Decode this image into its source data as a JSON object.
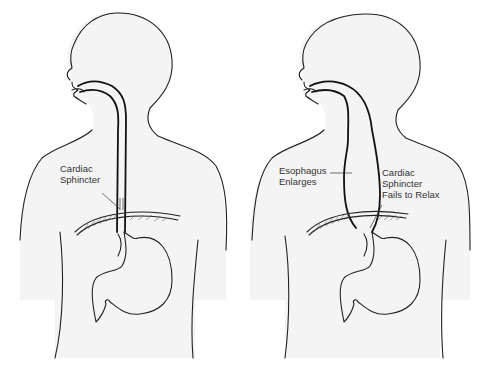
{
  "diagram": {
    "type": "medical-illustration",
    "topic": "Achalasia comparison: normal esophagus vs enlarged esophagus",
    "panels": [
      {
        "id": "normal",
        "labels": [
          {
            "line1": "Cardiac",
            "line2": "Sphincter"
          }
        ]
      },
      {
        "id": "achalasia",
        "labels": [
          {
            "line1": "Esophagus",
            "line2": "Enlarges"
          },
          {
            "line1": "Cardiac",
            "line2": "Sphincter",
            "line3": "Fails to Relax"
          }
        ]
      }
    ],
    "colors": {
      "background": "#ffffff",
      "silhouette": "#f4f4f4",
      "outline": "#222222",
      "text": "#333333"
    }
  }
}
